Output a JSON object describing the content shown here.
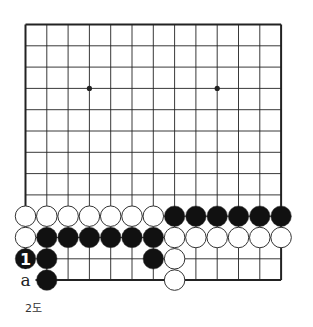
{
  "diagram": {
    "type": "go-board",
    "size": 13,
    "origin": {
      "x": 25.5,
      "y": 24.5
    },
    "spacing": 21.3,
    "hoshi": [
      [
        3,
        3
      ],
      [
        9,
        3
      ]
    ],
    "colors": {
      "line": "#222222",
      "black": "#111111",
      "white": "#ffffff",
      "stone_outline": "#333333"
    },
    "stones": [
      {
        "col": 0,
        "row": 9,
        "color": "white"
      },
      {
        "col": 1,
        "row": 9,
        "color": "white"
      },
      {
        "col": 2,
        "row": 9,
        "color": "white"
      },
      {
        "col": 3,
        "row": 9,
        "color": "white"
      },
      {
        "col": 4,
        "row": 9,
        "color": "white"
      },
      {
        "col": 5,
        "row": 9,
        "color": "white"
      },
      {
        "col": 6,
        "row": 9,
        "color": "white"
      },
      {
        "col": 7,
        "row": 9,
        "color": "black"
      },
      {
        "col": 8,
        "row": 9,
        "color": "black"
      },
      {
        "col": 9,
        "row": 9,
        "color": "black"
      },
      {
        "col": 10,
        "row": 9,
        "color": "black"
      },
      {
        "col": 11,
        "row": 9,
        "color": "black"
      },
      {
        "col": 12,
        "row": 9,
        "color": "black"
      },
      {
        "col": 0,
        "row": 10,
        "color": "white"
      },
      {
        "col": 1,
        "row": 10,
        "color": "black"
      },
      {
        "col": 2,
        "row": 10,
        "color": "black"
      },
      {
        "col": 3,
        "row": 10,
        "color": "black"
      },
      {
        "col": 4,
        "row": 10,
        "color": "black"
      },
      {
        "col": 5,
        "row": 10,
        "color": "black"
      },
      {
        "col": 6,
        "row": 10,
        "color": "black"
      },
      {
        "col": 7,
        "row": 10,
        "color": "white"
      },
      {
        "col": 8,
        "row": 10,
        "color": "white"
      },
      {
        "col": 9,
        "row": 10,
        "color": "white"
      },
      {
        "col": 10,
        "row": 10,
        "color": "white"
      },
      {
        "col": 11,
        "row": 10,
        "color": "white"
      },
      {
        "col": 12,
        "row": 10,
        "color": "white"
      },
      {
        "col": 0,
        "row": 11,
        "color": "black",
        "label": "1"
      },
      {
        "col": 1,
        "row": 11,
        "color": "black"
      },
      {
        "col": 6,
        "row": 11,
        "color": "black"
      },
      {
        "col": 7,
        "row": 11,
        "color": "white"
      },
      {
        "col": 1,
        "row": 12,
        "color": "black"
      },
      {
        "col": 7,
        "row": 12,
        "color": "white"
      }
    ],
    "point_labels": [
      {
        "col": 0,
        "row": 12,
        "text": "a"
      }
    ],
    "caption": "2도"
  }
}
